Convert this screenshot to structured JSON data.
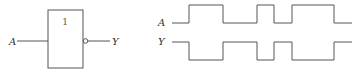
{
  "gate": {
    "symbol": "1",
    "input_label": "A",
    "output_label": "Y",
    "type": "NOT"
  },
  "waveforms": {
    "A": {
      "label": "A",
      "levels": [
        0,
        1,
        0,
        1,
        0,
        1,
        0
      ]
    },
    "Y": {
      "label": "Y",
      "levels": [
        1,
        0,
        1,
        0,
        1,
        0,
        1
      ]
    },
    "transitions_x": [
      172,
      189,
      223,
      257,
      274,
      292,
      334,
      352
    ]
  },
  "colors": {
    "stroke": "#555555"
  }
}
